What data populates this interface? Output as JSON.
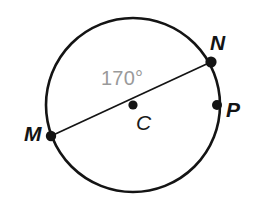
{
  "figure": {
    "type": "circle-with-diameter",
    "background_color": "#ffffff",
    "stroke_color": "#141414",
    "angle_label_color": "#9a9a9a"
  },
  "labels": {
    "point_m": "M",
    "point_n": "N",
    "point_p": "P",
    "center_c": "C",
    "angle": "170°"
  },
  "geometry": {
    "circle": {
      "cx": 133,
      "cy": 105,
      "r": 87,
      "stroke_width": 2.6
    },
    "diameter": {
      "from": "M",
      "to": "N",
      "x1": 51,
      "y1": 136,
      "x2": 211,
      "y2": 62,
      "stroke_width": 1.7
    },
    "points": [
      {
        "name": "M",
        "x": 51,
        "y": 136,
        "r": 5.2
      },
      {
        "name": "N",
        "x": 211,
        "y": 62,
        "r": 5.6
      },
      {
        "name": "P",
        "x": 217,
        "y": 105,
        "r": 5.0
      },
      {
        "name": "C",
        "x": 133,
        "y": 105,
        "r": 4.6
      }
    ]
  }
}
